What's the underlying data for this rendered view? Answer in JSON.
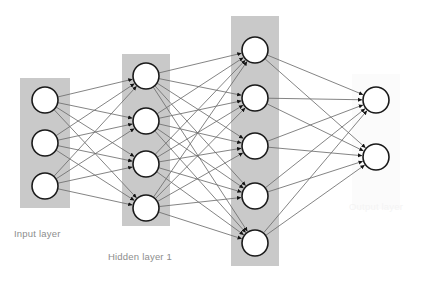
{
  "diagram": {
    "canvas": {
      "width": 423,
      "height": 283,
      "background": "#ffffff"
    },
    "colors": {
      "layer_box_gray": "#c9c9c9",
      "layer_box_light": "#fbfbfb",
      "node_fill": "#ffffff",
      "node_stroke": "#1a1a1a",
      "edge_stroke": "#6e6e6e",
      "arrowhead": "#141414",
      "label_gray": "#8d8d8d",
      "label_faint": "#f4f4f4"
    },
    "layers": [
      {
        "id": "input",
        "label": "Input layer",
        "label_color": "#8d8d8d",
        "node_count": 3,
        "box": {
          "x": 20,
          "y": 78,
          "width": 50,
          "height": 130,
          "fill": "#c9c9c9"
        },
        "node_radius": 13,
        "node_cx": 45,
        "node_cys": [
          100,
          143,
          186
        ]
      },
      {
        "id": "hidden1",
        "label": "Hidden layer 1",
        "label_color": "#8d8d8d",
        "node_count": 4,
        "box": {
          "x": 122,
          "y": 54,
          "width": 48,
          "height": 172,
          "fill": "#c9c9c9"
        },
        "node_radius": 13,
        "node_cx": 146,
        "node_cys": [
          76,
          121,
          164,
          208
        ]
      },
      {
        "id": "hidden2",
        "label": "",
        "label_color": "#8d8d8d",
        "node_count": 5,
        "box": {
          "x": 231,
          "y": 16,
          "width": 48,
          "height": 250,
          "fill": "#c9c9c9"
        },
        "node_radius": 13,
        "node_cx": 255,
        "node_cys": [
          50,
          98,
          146,
          196,
          243
        ]
      },
      {
        "id": "output",
        "label": "Output layer",
        "label_color": "#f4f4f4",
        "node_count": 2,
        "box": {
          "x": 352,
          "y": 74,
          "width": 48,
          "height": 135,
          "fill": "#fbfbfb"
        },
        "node_radius": 13,
        "node_cx": 376,
        "node_cys": [
          100,
          157
        ]
      }
    ],
    "connections": [
      {
        "from": "input",
        "to": "hidden1",
        "type": "fully-connected",
        "edge_count": 12
      },
      {
        "from": "hidden1",
        "to": "hidden2",
        "type": "fully-connected",
        "edge_count": 20
      },
      {
        "from": "hidden2",
        "to": "output",
        "type": "fully-connected",
        "edge_count": 10
      }
    ],
    "labels": {
      "input": "Input layer",
      "hidden1": "Hidden layer 1",
      "output": "Output layer"
    }
  }
}
